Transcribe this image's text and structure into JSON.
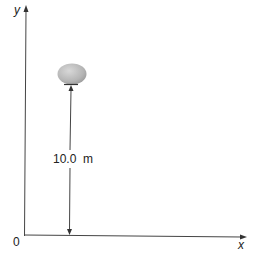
{
  "axes": {
    "x_label": "x",
    "y_label": "y",
    "origin_label": "0"
  },
  "object": {
    "name": "egg",
    "color": "#b8b8b8"
  },
  "dimension": {
    "label": "10.0  m",
    "value": 10.0,
    "unit": "m"
  },
  "colors": {
    "line": "#333333",
    "background": "#ffffff"
  }
}
